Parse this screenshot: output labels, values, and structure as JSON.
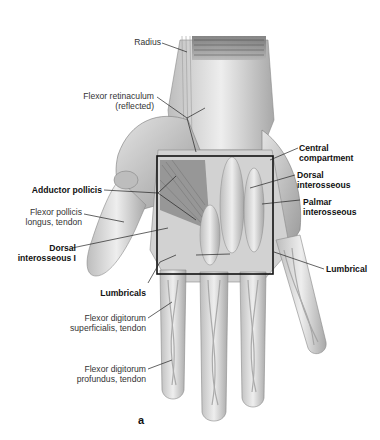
{
  "figure": {
    "caption": "a",
    "box_color": "#111111",
    "illustration_tone": "#c8c8c8"
  },
  "labels": {
    "radius": "Radius",
    "flexor_retinaculum_1": "Flexor retinaculum",
    "flexor_retinaculum_2": "(reflected)",
    "adductor_pollicis": "Adductor pollicis",
    "flexor_pollicis_1": "Flexor pollicis",
    "flexor_pollicis_2": "longus, tendon",
    "dorsal_interosseous_i_1": "Dorsal",
    "dorsal_interosseous_i_2": "interosseous I",
    "lumbricals": "Lumbricals",
    "fds_1": "Flexor digitorum",
    "fds_2": "superficialis, tendon",
    "fdp_1": "Flexor digitorum",
    "fdp_2": "profundus, tendon",
    "central_compartment_1": "Central",
    "central_compartment_2": "compartment",
    "dorsal_interosseous_1": "Dorsal",
    "dorsal_interosseous_2": "interosseous",
    "palmar_interosseous_1": "Palmar",
    "palmar_interosseous_2": "interosseous",
    "lumbrical": "Lumbrical"
  }
}
